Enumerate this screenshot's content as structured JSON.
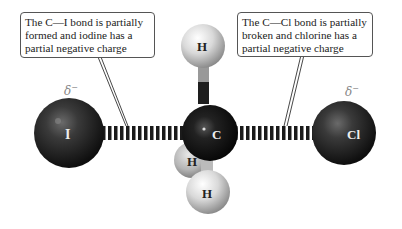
{
  "diagram": {
    "type": "SN2 transition state ball-and-stick model",
    "callouts": {
      "left": {
        "lines": [
          "The C—I bond is partially",
          "formed and iodine has a",
          "partial negative charge"
        ]
      },
      "right": {
        "lines": [
          "The C—Cl bond is partially",
          "broken and chlorine has a",
          "partial negative charge"
        ]
      }
    },
    "charges": {
      "iodine": "δ",
      "chlorine": "δ",
      "sign": "−"
    },
    "atoms": {
      "iodine": "I",
      "carbon": "C",
      "chlorine": "Cl",
      "h_top": "H",
      "h_back": "H",
      "h_front": "H"
    },
    "colors": {
      "dark_atom": "#2a2a2a",
      "light_atom": "#e6e6e6",
      "callout_border": "#555555",
      "delta_text": "#888888"
    }
  }
}
